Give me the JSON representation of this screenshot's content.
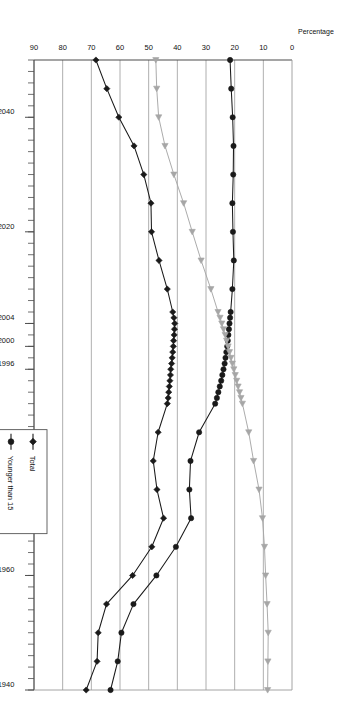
{
  "chart_data": {
    "type": "line",
    "title": "",
    "subtitle": "",
    "xlabel": "",
    "ylabel": "Percentage",
    "orientation": "rotated-180",
    "grid": "vertical-value-gridlines",
    "legend_position": "inside-left-lower",
    "xlim": [
      1940,
      2050
    ],
    "ylim": [
      0,
      90
    ],
    "y_ticks": [
      0,
      10,
      20,
      30,
      40,
      50,
      60,
      70,
      80,
      90
    ],
    "x_tick_labels": [
      "1940",
      "1960",
      "1980",
      "1996",
      "2000",
      "2004",
      "2020",
      "2040"
    ],
    "x_tick_values": [
      1940,
      1960,
      1980,
      1996,
      2000,
      2004,
      2020,
      2040
    ],
    "x_minor_tick_interval": 2,
    "series": [
      {
        "name": "Total",
        "color": "#1a1a1a",
        "marker": "diamond",
        "x": [
          1940,
          1945,
          1950,
          1955,
          1960,
          1965,
          1970,
          1975,
          1980,
          1985,
          1990,
          1991,
          1992,
          1993,
          1994,
          1995,
          1996,
          1997,
          1998,
          1999,
          2000,
          2001,
          2002,
          2003,
          2004,
          2005,
          2006,
          2010,
          2015,
          2020,
          2025,
          2030,
          2035,
          2040,
          2045,
          2050
        ],
        "values": [
          71.8,
          68.0,
          67.6,
          64.7,
          55.6,
          48.9,
          44.8,
          47.1,
          48.4,
          46.7,
          43.5,
          43.2,
          43.0,
          42.8,
          42.6,
          42.4,
          42.3,
          42.0,
          41.8,
          41.6,
          41.4,
          41.3,
          41.1,
          41.0,
          40.9,
          41.2,
          41.6,
          43.5,
          46.4,
          49.0,
          49.2,
          51.7,
          55.1,
          60.4,
          64.6,
          68.4
        ]
      },
      {
        "name": "Younger than 15",
        "color": "#1a1a1a",
        "marker": "circle",
        "x": [
          1940,
          1945,
          1950,
          1955,
          1960,
          1965,
          1970,
          1975,
          1980,
          1985,
          1990,
          1991,
          1992,
          1993,
          1994,
          1995,
          1996,
          1997,
          1998,
          1999,
          2000,
          2001,
          2002,
          2003,
          2004,
          2005,
          2006,
          2010,
          2015,
          2020,
          2025,
          2030,
          2035,
          2040,
          2045,
          2050
        ],
        "values": [
          63.3,
          60.8,
          59.5,
          55.3,
          47.3,
          40.5,
          35.2,
          35.8,
          35.4,
          32.4,
          26.8,
          26.2,
          25.7,
          25.2,
          24.7,
          24.3,
          23.9,
          23.5,
          23.2,
          22.9,
          22.6,
          22.4,
          22.2,
          22.0,
          21.8,
          21.6,
          21.4,
          20.8,
          20.3,
          20.6,
          20.8,
          20.5,
          20.4,
          20.7,
          21.2,
          21.6
        ]
      },
      {
        "name": "Over 65",
        "color": "#a6a6a6",
        "marker": "triangle",
        "x": [
          1940,
          1945,
          1950,
          1955,
          1960,
          1965,
          1970,
          1975,
          1980,
          1985,
          1990,
          1991,
          1992,
          1993,
          1994,
          1995,
          1996,
          1997,
          1998,
          1999,
          2000,
          2001,
          2002,
          2003,
          2004,
          2005,
          2006,
          2010,
          2015,
          2020,
          2025,
          2030,
          2035,
          2040,
          2045,
          2050
        ],
        "values": [
          8.5,
          8.4,
          8.3,
          8.7,
          9.2,
          9.6,
          10.3,
          11.5,
          13.4,
          15.1,
          17.3,
          17.8,
          18.3,
          18.8,
          19.3,
          19.8,
          20.3,
          20.8,
          21.3,
          21.8,
          22.3,
          22.8,
          23.3,
          23.9,
          24.5,
          25.1,
          25.8,
          28.3,
          31.7,
          34.8,
          37.8,
          41.2,
          44.3,
          46.5,
          47.2,
          47.5
        ]
      }
    ]
  },
  "axes": {
    "value_axis_title": "Percentage",
    "value_axis_ticks": [
      "90",
      "80",
      "70",
      "60",
      "50",
      "40",
      "30",
      "20",
      "10",
      "0"
    ],
    "year_axis_ticks": [
      "1940",
      "1960",
      "1980",
      "1996",
      "2000",
      "2004",
      "2020",
      "2040"
    ]
  },
  "legend": {
    "entries": [
      {
        "label": "Total",
        "marker": "diamond",
        "color": "#1a1a1a"
      },
      {
        "label": "Younger than 15",
        "marker": "circle",
        "color": "#1a1a1a"
      },
      {
        "label": "Over 65",
        "marker": "triangle",
        "color": "#a6a6a6"
      }
    ]
  },
  "colors": {
    "total": "#1a1a1a",
    "younger": "#1a1a1a",
    "over65": "#a6a6a6",
    "grid": "#9a9a9a",
    "axis": "#4d4d4d",
    "background": "#ffffff"
  }
}
